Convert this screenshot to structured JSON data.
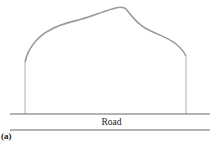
{
  "diagram": {
    "road_label": "Road",
    "figure_label": "(a)",
    "colors": {
      "profile_curve": "#9a9a9a",
      "walls": "#9a9a9a",
      "road_lines": "#555555",
      "background": "#ffffff"
    }
  }
}
